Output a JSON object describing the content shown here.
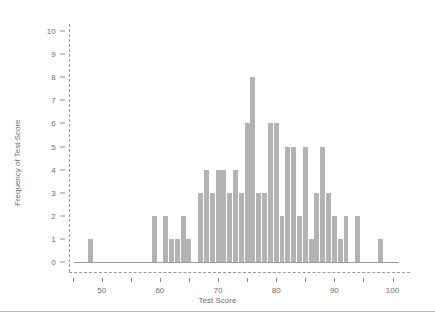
{
  "chart_data": {
    "type": "bar",
    "title": "",
    "subtitle": "",
    "xlabel": "Test Score",
    "ylabel": "Frequency of Test Score",
    "xlim": [
      43,
      103
    ],
    "ylim": [
      0,
      10
    ],
    "grid": false,
    "legend": null,
    "bar_color": "#b3b3b3",
    "axis_color": "#9a9a9a",
    "text_color": "#6e6e6e",
    "xticks": [
      45,
      50,
      55,
      60,
      65,
      70,
      75,
      80,
      85,
      90,
      95,
      100
    ],
    "xtick_labels": [
      "",
      "50",
      "",
      "60",
      "",
      "70",
      "",
      "80",
      "",
      "90",
      "",
      "100"
    ],
    "yticks": [
      0,
      1,
      2,
      3,
      4,
      5,
      6,
      7,
      8,
      9,
      10
    ],
    "ytick_labels": [
      "0",
      "1",
      "2",
      "3",
      "4",
      "5",
      "6",
      "7",
      "8",
      "9",
      "10"
    ],
    "x": [
      48,
      59,
      61,
      62,
      63,
      64,
      65,
      67,
      68,
      69,
      70,
      71,
      72,
      73,
      74,
      75,
      76,
      77,
      78,
      79,
      80,
      81,
      82,
      83,
      84,
      85,
      86,
      87,
      88,
      89,
      90,
      91,
      92,
      94,
      98
    ],
    "values": [
      1,
      2,
      2,
      1,
      1,
      2,
      1,
      3,
      4,
      3,
      4,
      4,
      3,
      4,
      3,
      6,
      8,
      3,
      3,
      6,
      6,
      2,
      5,
      5,
      2,
      5,
      1,
      3,
      5,
      3,
      2,
      1,
      2,
      2,
      1
    ],
    "categories": [
      "48",
      "59",
      "61",
      "62",
      "63",
      "64",
      "65",
      "67",
      "68",
      "69",
      "70",
      "71",
      "72",
      "73",
      "74",
      "75",
      "76",
      "77",
      "78",
      "79",
      "80",
      "81",
      "82",
      "83",
      "84",
      "85",
      "86",
      "87",
      "88",
      "89",
      "90",
      "91",
      "92",
      "94",
      "98"
    ],
    "max_value": 8,
    "bar_width_units": 0.85
  },
  "figure": {
    "divider_color": "#b9b9b9"
  }
}
